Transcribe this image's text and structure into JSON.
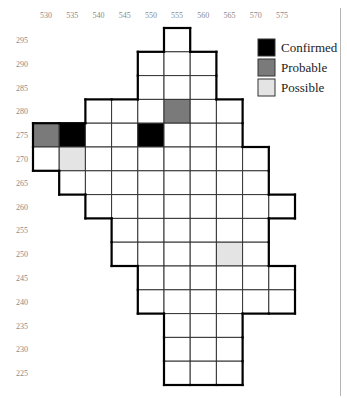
{
  "map": {
    "title": "",
    "x_axis": {
      "labels": [
        "530",
        "535",
        "540",
        "545",
        "550",
        "555",
        "560",
        "565",
        "570",
        "575"
      ]
    },
    "y_axis": {
      "labels": [
        "295",
        "290",
        "285",
        "280",
        "275",
        "270",
        "265",
        "260",
        "255",
        "250",
        "245",
        "240",
        "235",
        "230",
        "225"
      ]
    },
    "rows": [
      {
        "y": "295",
        "start": 5,
        "end": 5
      },
      {
        "y": "290",
        "start": 4,
        "end": 6
      },
      {
        "y": "285",
        "start": 4,
        "end": 6
      },
      {
        "y": "280",
        "start": 2,
        "end": 7
      },
      {
        "y": "275",
        "start": 0,
        "end": 7
      },
      {
        "y": "270",
        "start": 0,
        "end": 8
      },
      {
        "y": "265",
        "start": 1,
        "end": 8
      },
      {
        "y": "260",
        "start": 2,
        "end": 9
      },
      {
        "y": "255",
        "start": 3,
        "end": 8
      },
      {
        "y": "250",
        "start": 3,
        "end": 8
      },
      {
        "y": "245",
        "start": 4,
        "end": 9
      },
      {
        "y": "240",
        "start": 4,
        "end": 9
      },
      {
        "y": "235",
        "start": 5,
        "end": 7
      },
      {
        "y": "230",
        "start": 5,
        "end": 7
      },
      {
        "y": "225",
        "start": 5,
        "end": 7
      }
    ],
    "records": [
      {
        "x": "530",
        "y": "275",
        "status": "probable"
      },
      {
        "x": "535",
        "y": "275",
        "status": "confirmed"
      },
      {
        "x": "550",
        "y": "275",
        "status": "confirmed"
      },
      {
        "x": "555",
        "y": "280",
        "status": "probable"
      },
      {
        "x": "535",
        "y": "270",
        "status": "possible"
      },
      {
        "x": "565",
        "y": "250",
        "status": "possible"
      }
    ]
  },
  "legend": {
    "items": [
      {
        "key": "confirmed",
        "label": "Confirmed",
        "color": "#000000"
      },
      {
        "key": "probable",
        "label": "Probable",
        "color": "#7a7a7a"
      },
      {
        "key": "possible",
        "label": "Possible",
        "color": "#e4e4e4"
      }
    ]
  },
  "colors": {
    "empty_cell": "#ffffff",
    "grid_line": "#333333",
    "outline": "#000000",
    "axis_text": "#8a8a8a"
  }
}
